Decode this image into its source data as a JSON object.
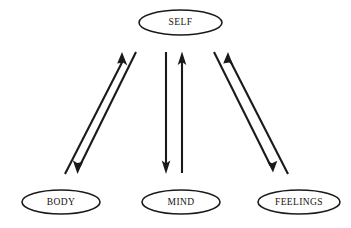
{
  "diagram": {
    "background_color": "#ffffff",
    "stroke_color": "#1a1a1a",
    "text_color": "#15120f",
    "nodes": [
      {
        "id": "self",
        "label": "SELF",
        "cx": 180.5,
        "cy": 22.5,
        "rx": 41.5,
        "ry": 12.5
      },
      {
        "id": "body",
        "label": "BODY",
        "cx": 61,
        "cy": 202,
        "rx": 39,
        "ry": 12
      },
      {
        "id": "mind",
        "label": "MIND",
        "cx": 181,
        "cy": 202,
        "rx": 39,
        "ry": 12
      },
      {
        "id": "feelings",
        "label": "FEELINGS",
        "cx": 299,
        "cy": 202,
        "rx": 41,
        "ry": 12
      }
    ],
    "connections": [
      {
        "id": "body-to-self",
        "from": "body",
        "to": "self",
        "direction": "up",
        "x1": 65,
        "y1": 174,
        "x2": 122,
        "y2": 53
      },
      {
        "id": "self-to-body",
        "from": "self",
        "to": "body",
        "direction": "down",
        "x1": 136,
        "y1": 52,
        "x2": 78,
        "y2": 173
      },
      {
        "id": "self-to-mind",
        "from": "self",
        "to": "mind",
        "direction": "down",
        "x1": 166,
        "y1": 52,
        "x2": 166,
        "y2": 173
      },
      {
        "id": "mind-to-self",
        "from": "mind",
        "to": "self",
        "direction": "up",
        "x1": 182,
        "y1": 173,
        "x2": 182,
        "y2": 53
      },
      {
        "id": "feelings-to-self",
        "from": "feelings",
        "to": "self",
        "direction": "up",
        "x1": 288,
        "y1": 174,
        "x2": 228,
        "y2": 53
      },
      {
        "id": "self-to-feelings",
        "from": "self",
        "to": "feelings",
        "direction": "down",
        "x1": 214,
        "y1": 52,
        "x2": 272,
        "y2": 172
      }
    ]
  }
}
